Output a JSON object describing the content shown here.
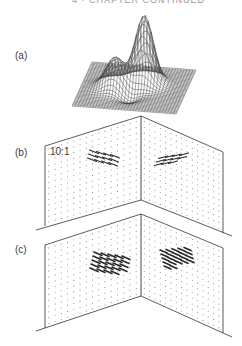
{
  "figure": {
    "header_fragment": "4 · CHAPTER CONTINUED",
    "panels": [
      {
        "id": "a",
        "label": "(a)",
        "type": "3d-surface-mesh",
        "description": "Wireframe surface with a tall central peak and a lower secondary peak"
      },
      {
        "id": "b",
        "label": "(b)",
        "type": "vector-field-corner",
        "scale_label": "10:1",
        "description": "Two orthogonal faces with dot grid and elongated arrow clusters"
      },
      {
        "id": "c",
        "label": "(c)",
        "type": "vector-field-corner",
        "description": "Two orthogonal faces with dot grid and dense dark arrow clusters"
      }
    ],
    "colors": {
      "ink": "#333333",
      "grid_dot": "#8a8a8a",
      "background": "#ffffff"
    }
  }
}
